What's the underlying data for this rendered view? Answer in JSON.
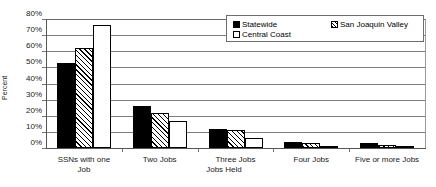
{
  "chart_data": {
    "type": "bar",
    "title": "",
    "xlabel": "Jobs Held",
    "ylabel": "Percent",
    "ylim": [
      0,
      80
    ],
    "grid": true,
    "legend_position": "top-right",
    "categories": [
      "SSNs with one Job",
      "Two Jobs",
      "Three Jobs",
      "Four Jobs",
      "Five or more Jobs"
    ],
    "category_lines": [
      [
        "SSNs with one",
        "Job"
      ],
      [
        "Two Jobs",
        ""
      ],
      [
        "Three Jobs",
        ""
      ],
      [
        "Four Jobs",
        ""
      ],
      [
        "Five or more Jobs",
        ""
      ]
    ],
    "y_ticks": [
      "0%",
      "10%",
      "20%",
      "30%",
      "40%",
      "50%",
      "60%",
      "70%",
      "80%"
    ],
    "y_tick_values": [
      0,
      10,
      20,
      30,
      40,
      50,
      60,
      70,
      80
    ],
    "series": [
      {
        "name": "Statewide",
        "fill": "solid-black",
        "values": [
          53,
          26,
          12,
          4,
          3
        ]
      },
      {
        "name": "San Joaquin Valley",
        "fill": "diagonal-hatch",
        "values": [
          62,
          22,
          11,
          3,
          2
        ]
      },
      {
        "name": "Central Coast",
        "fill": "white",
        "values": [
          76,
          17,
          6,
          1,
          0.7
        ]
      }
    ]
  },
  "legend": {
    "entries": [
      {
        "label": "Statewide"
      },
      {
        "label": "Central Coast"
      },
      {
        "label": "San Joaquin Valley"
      }
    ]
  },
  "colors": {
    "statewide": "#000000",
    "san_joaquin_valley": "#ffffff",
    "central_coast": "#ffffff",
    "axis": "#555555",
    "gridline": "#7d7d7d",
    "background": "#ffffff"
  }
}
